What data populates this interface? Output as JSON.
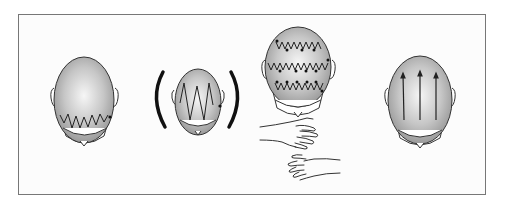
{
  "figure": {
    "colors": {
      "frame": "#777777",
      "scalp_light": "#f4f4f4",
      "scalp_dark": "#9a9a9a",
      "stroke": "#222222"
    },
    "panels": [
      {
        "id": "zigzag-back",
        "label": ""
      },
      {
        "id": "zigzag-large-optional",
        "label": ""
      },
      {
        "id": "zigzag-rows-with-hands",
        "label": ""
      },
      {
        "id": "straight-strokes",
        "label": ""
      }
    ]
  }
}
